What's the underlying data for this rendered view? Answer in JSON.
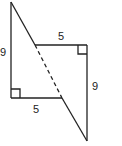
{
  "diagram": {
    "left_triangle": {
      "vertical_leg_label": "9",
      "horizontal_leg_label": "5"
    },
    "right_triangle": {
      "vertical_leg_label": "9",
      "horizontal_leg_label": "5"
    },
    "stroke_color": "#222222"
  }
}
